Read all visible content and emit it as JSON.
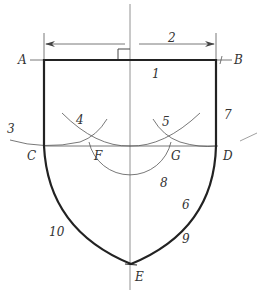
{
  "diagram": {
    "type": "geometric construction (ogee / pointed shield outline)",
    "points": {
      "A": "A",
      "B": "B",
      "C": "C",
      "D": "D",
      "E": "E",
      "F": "F",
      "G": "G"
    },
    "step_numbers": {
      "n1": "1",
      "n2": "2",
      "n3": "3",
      "n4": "4",
      "n5": "5",
      "n6": "6",
      "n7": "7",
      "n8": "8",
      "n9": "9",
      "n10": "10"
    },
    "colors": {
      "outline": "#222222",
      "construction": "#555555",
      "text": "#333333"
    }
  }
}
